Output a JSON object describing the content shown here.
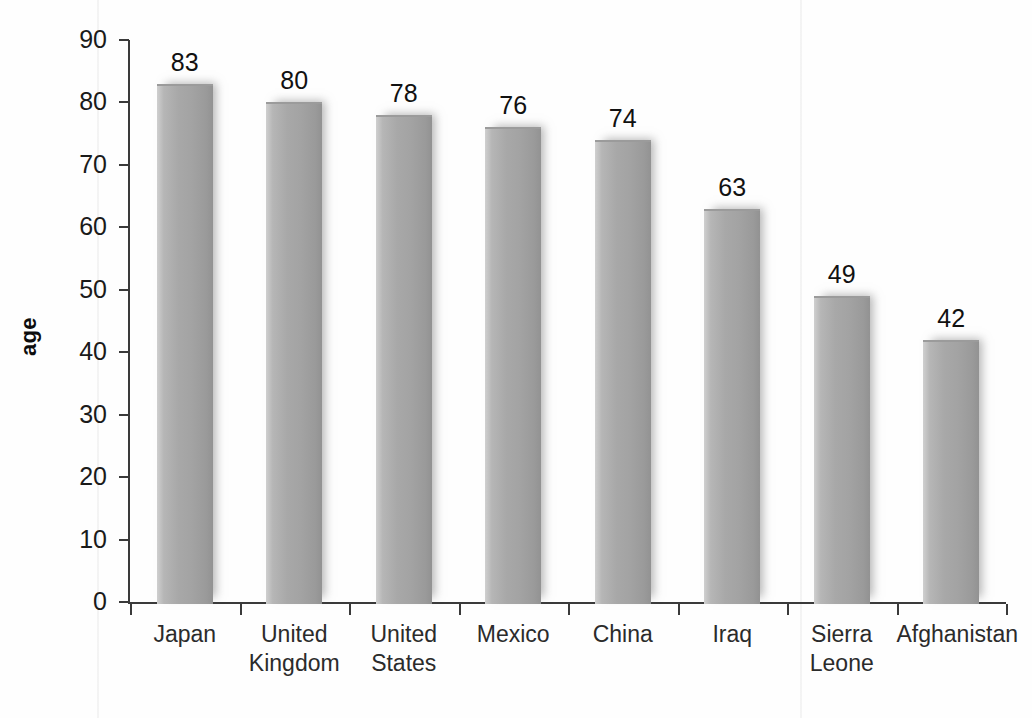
{
  "chart_data": {
    "type": "bar",
    "title": "",
    "subtitle": "",
    "xlabel": "",
    "ylabel": "age",
    "ylim": [
      0,
      90
    ],
    "ytick_step": 10,
    "yticks": [
      0,
      10,
      20,
      30,
      40,
      50,
      60,
      70,
      80,
      90
    ],
    "grid": false,
    "legend": false,
    "legend_position": "none",
    "categories": [
      "Japan",
      "United Kingdom",
      "United States",
      "Mexico",
      "China",
      "Iraq",
      "Sierra Leone",
      "Afghanistan"
    ],
    "category_label_lines": [
      "Japan",
      "United\nKingdom",
      "United\nStates",
      "Mexico",
      "China",
      "Iraq",
      "Sierra\nLeone",
      "Afghanistan"
    ],
    "values": [
      83,
      80,
      78,
      76,
      74,
      63,
      49,
      42
    ],
    "bar_color": "#a8a8a8",
    "bar_color_light": "#cfcfcf",
    "bar_color_dark": "#929292",
    "axis_color": "#3a3a3a",
    "text_color": "#1a1a1a"
  },
  "axis": {
    "y_title": "age",
    "y_labels": [
      "90",
      "80",
      "70",
      "60",
      "50",
      "40",
      "30",
      "20",
      "10",
      "0"
    ]
  },
  "bars": [
    {
      "label": "Japan",
      "value_text": "83"
    },
    {
      "label": "United Kingdom",
      "value_text": "80"
    },
    {
      "label": "United States",
      "value_text": "78"
    },
    {
      "label": "Mexico",
      "value_text": "76"
    },
    {
      "label": "China",
      "value_text": "74"
    },
    {
      "label": "Iraq",
      "value_text": "63"
    },
    {
      "label": "Sierra Leone",
      "value_text": "49"
    },
    {
      "label": "Afghanistan",
      "value_text": "42"
    }
  ]
}
